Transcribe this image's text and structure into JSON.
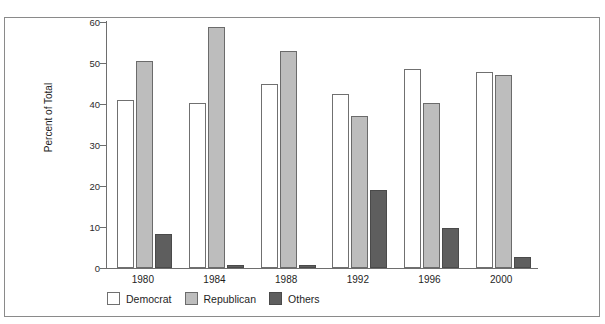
{
  "chart_data": {
    "type": "bar",
    "title": "",
    "xlabel": "",
    "ylabel": "Percent of Total",
    "categories": [
      "1980",
      "1984",
      "1988",
      "1992",
      "1996",
      "2000"
    ],
    "series": [
      {
        "name": "Democrat",
        "color": "#ffffff",
        "values": [
          41.0,
          40.3,
          45.0,
          42.5,
          48.6,
          47.9
        ]
      },
      {
        "name": "Republican",
        "color": "#bdbdbd",
        "values": [
          50.6,
          58.8,
          53.0,
          37.1,
          40.2,
          47.0
        ]
      },
      {
        "name": "Others",
        "color": "#5e5e5e",
        "values": [
          8.2,
          0.7,
          0.7,
          19.0,
          9.7,
          2.7
        ]
      }
    ],
    "ylim": [
      0,
      60
    ],
    "yticks": [
      0,
      10,
      20,
      30,
      40,
      50,
      60
    ],
    "ytick_labels": [
      "0",
      "10",
      "20",
      "30",
      "40",
      "50",
      "60"
    ],
    "grid": false,
    "legend_position": "bottom-left"
  }
}
